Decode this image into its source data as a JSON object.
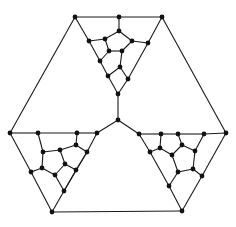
{
  "diagram": {
    "type": "graph",
    "style": {
      "edge_color": "#1a1a1a",
      "node_color": "#111111",
      "node_radius": 2.4,
      "background": "#ffffff"
    },
    "nodes": [
      {
        "id": "t_tl",
        "x": 75,
        "y": 17
      },
      {
        "id": "t_tm",
        "x": 119,
        "y": 17
      },
      {
        "id": "t_tr",
        "x": 162,
        "y": 17
      },
      {
        "id": "t_a",
        "x": 119,
        "y": 31
      },
      {
        "id": "t_b",
        "x": 105,
        "y": 39
      },
      {
        "id": "t_c",
        "x": 132,
        "y": 41
      },
      {
        "id": "t_f",
        "x": 89,
        "y": 41
      },
      {
        "id": "t_g",
        "x": 148,
        "y": 43
      },
      {
        "id": "t_d",
        "x": 109,
        "y": 51
      },
      {
        "id": "t_e",
        "x": 122,
        "y": 51
      },
      {
        "id": "t_h",
        "x": 100,
        "y": 61
      },
      {
        "id": "t_i",
        "x": 120,
        "y": 67
      },
      {
        "id": "t_j",
        "x": 108,
        "y": 76
      },
      {
        "id": "t_k",
        "x": 128,
        "y": 79
      },
      {
        "id": "t_bot",
        "x": 118,
        "y": 94
      },
      {
        "id": "center",
        "x": 118,
        "y": 120
      },
      {
        "id": "l_corner",
        "x": 10,
        "y": 133
      },
      {
        "id": "l_p",
        "x": 38,
        "y": 133
      },
      {
        "id": "l_s0",
        "x": 77,
        "y": 133
      },
      {
        "id": "l_tr",
        "x": 97,
        "y": 133
      },
      {
        "id": "l_s",
        "x": 76,
        "y": 145
      },
      {
        "id": "l_q",
        "x": 43,
        "y": 152
      },
      {
        "id": "l_r",
        "x": 60,
        "y": 150
      },
      {
        "id": "l_t",
        "x": 87,
        "y": 152
      },
      {
        "id": "l_u",
        "x": 65,
        "y": 164
      },
      {
        "id": "l_v",
        "x": 42,
        "y": 168
      },
      {
        "id": "l_x",
        "x": 31,
        "y": 172
      },
      {
        "id": "l_w",
        "x": 55,
        "y": 175
      },
      {
        "id": "l_y",
        "x": 76,
        "y": 170
      },
      {
        "id": "l_z",
        "x": 64,
        "y": 191
      },
      {
        "id": "l_bot",
        "x": 52,
        "y": 212
      },
      {
        "id": "r_tl",
        "x": 139,
        "y": 134
      },
      {
        "id": "r_a",
        "x": 161,
        "y": 134
      },
      {
        "id": "r_b",
        "x": 178,
        "y": 134
      },
      {
        "id": "r_c",
        "x": 204,
        "y": 134
      },
      {
        "id": "r_corner",
        "x": 226,
        "y": 133
      },
      {
        "id": "r_e",
        "x": 160,
        "y": 148
      },
      {
        "id": "r_d",
        "x": 150,
        "y": 152
      },
      {
        "id": "r_f",
        "x": 182,
        "y": 145
      },
      {
        "id": "r_g",
        "x": 172,
        "y": 155
      },
      {
        "id": "r_h",
        "x": 195,
        "y": 151
      },
      {
        "id": "r_j",
        "x": 193,
        "y": 169
      },
      {
        "id": "r_i",
        "x": 178,
        "y": 172
      },
      {
        "id": "r_k",
        "x": 202,
        "y": 176
      },
      {
        "id": "r_l",
        "x": 169,
        "y": 186
      },
      {
        "id": "r_bot",
        "x": 182,
        "y": 211
      }
    ],
    "edges": [
      [
        "t_tl",
        "t_tm"
      ],
      [
        "t_tm",
        "t_tr"
      ],
      [
        "t_tl",
        "t_f"
      ],
      [
        "t_f",
        "t_h"
      ],
      [
        "t_h",
        "t_j"
      ],
      [
        "t_j",
        "t_bot"
      ],
      [
        "t_tr",
        "t_g"
      ],
      [
        "t_g",
        "t_k"
      ],
      [
        "t_k",
        "t_bot"
      ],
      [
        "t_tm",
        "t_a"
      ],
      [
        "t_a",
        "t_b"
      ],
      [
        "t_a",
        "t_c"
      ],
      [
        "t_b",
        "t_f"
      ],
      [
        "t_b",
        "t_d"
      ],
      [
        "t_c",
        "t_e"
      ],
      [
        "t_c",
        "t_g"
      ],
      [
        "t_d",
        "t_e"
      ],
      [
        "t_d",
        "t_h"
      ],
      [
        "t_e",
        "t_i"
      ],
      [
        "t_i",
        "t_j"
      ],
      [
        "t_i",
        "t_k"
      ],
      [
        "t_bot",
        "center"
      ],
      [
        "center",
        "l_tr"
      ],
      [
        "center",
        "r_tl"
      ],
      [
        "t_tl",
        "l_corner"
      ],
      [
        "t_tr",
        "r_corner"
      ],
      [
        "l_bot",
        "r_bot"
      ],
      [
        "l_corner",
        "l_p"
      ],
      [
        "l_p",
        "l_s0"
      ],
      [
        "l_s0",
        "l_tr"
      ],
      [
        "l_corner",
        "l_x"
      ],
      [
        "l_x",
        "l_bot"
      ],
      [
        "l_tr",
        "l_t"
      ],
      [
        "l_t",
        "l_z"
      ],
      [
        "l_z",
        "l_bot"
      ],
      [
        "l_p",
        "l_q"
      ],
      [
        "l_q",
        "l_r"
      ],
      [
        "l_r",
        "l_s"
      ],
      [
        "l_s",
        "l_s0"
      ],
      [
        "l_s",
        "l_t"
      ],
      [
        "l_q",
        "l_v"
      ],
      [
        "l_v",
        "l_x"
      ],
      [
        "l_v",
        "l_w"
      ],
      [
        "l_r",
        "l_u"
      ],
      [
        "l_u",
        "l_w"
      ],
      [
        "l_u",
        "l_y"
      ],
      [
        "l_y",
        "l_t"
      ],
      [
        "l_w",
        "l_z"
      ],
      [
        "l_y",
        "l_z"
      ],
      [
        "r_tl",
        "r_a"
      ],
      [
        "r_a",
        "r_b"
      ],
      [
        "r_b",
        "r_c"
      ],
      [
        "r_c",
        "r_corner"
      ],
      [
        "r_tl",
        "r_d"
      ],
      [
        "r_d",
        "r_l"
      ],
      [
        "r_l",
        "r_bot"
      ],
      [
        "r_corner",
        "r_k"
      ],
      [
        "r_k",
        "r_bot"
      ],
      [
        "r_a",
        "r_e"
      ],
      [
        "r_e",
        "r_d"
      ],
      [
        "r_e",
        "r_g"
      ],
      [
        "r_b",
        "r_f"
      ],
      [
        "r_f",
        "r_g"
      ],
      [
        "r_f",
        "r_h"
      ],
      [
        "r_c",
        "r_h"
      ],
      [
        "r_h",
        "r_j"
      ],
      [
        "r_g",
        "r_i"
      ],
      [
        "r_i",
        "r_j"
      ],
      [
        "r_j",
        "r_k"
      ],
      [
        "r_i",
        "r_l"
      ]
    ]
  }
}
